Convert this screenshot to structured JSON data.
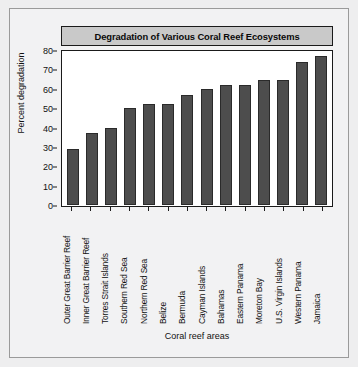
{
  "chart_data": {
    "type": "bar",
    "title": "Degradation of Various Coral Reef Ecosystems",
    "xlabel": "Coral reef areas",
    "ylabel": "Percent degradation",
    "ylim": [
      0,
      80
    ],
    "yticks": [
      0,
      10,
      20,
      30,
      40,
      50,
      60,
      70,
      80
    ],
    "grid": false,
    "legend": null,
    "bar_color": "#4d4d4d",
    "categories": [
      "Outer Great Barrier Reef",
      "Inner Great Barrier Reef",
      "Torres Strait Islands",
      "Southern Red Sea",
      "Northern Red Sea",
      "Belize",
      "Bermuda",
      "Cayman Islands",
      "Bahamas",
      "Eastern Panama",
      "Moreton Bay",
      "U.S. Virgin Islands",
      "Western Panama",
      "Jamaica"
    ],
    "values": [
      29,
      37,
      40,
      50,
      52,
      52,
      57,
      60,
      62,
      62,
      64.5,
      64.5,
      74,
      77
    ]
  }
}
